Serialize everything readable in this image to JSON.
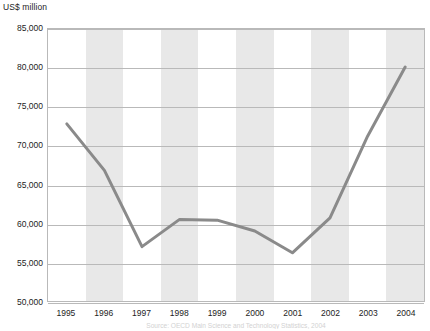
{
  "chart_data": {
    "type": "line",
    "title": "",
    "subtitle": "",
    "xlabel": "",
    "ylabel": "US$ million",
    "categories": [
      "1995",
      "1996",
      "1997",
      "1998",
      "1999",
      "2000",
      "2001",
      "2002",
      "2003",
      "2004"
    ],
    "values": [
      72800,
      66800,
      57000,
      60500,
      60400,
      59000,
      56200,
      60700,
      71200,
      80100
    ],
    "series": [
      {
        "name": "US$ million",
        "values": [
          72800,
          66800,
          57000,
          60500,
          60400,
          59000,
          56200,
          60700,
          71200,
          80100
        ]
      }
    ],
    "ylim": [
      50000,
      85000
    ],
    "ytick_step": 5000,
    "ytick_labels": [
      "85,000",
      "80,000",
      "75,000",
      "70,000",
      "65,000",
      "60,000",
      "55,000",
      "50,000"
    ],
    "ytick_values": [
      85000,
      80000,
      75000,
      70000,
      65000,
      60000,
      55000,
      50000
    ],
    "grid": "horizontal",
    "legend": "none",
    "line_color": "#8a8a8a",
    "band_color": "#e8e8e8",
    "axis_color": "#b9b9b9",
    "band_pattern": "alternating-vertical-by-year"
  },
  "axis": {
    "unit_label": "US$ million"
  },
  "footer": {
    "source_note": "Source: OECD Main Science and Technology Statistics, 2004"
  }
}
